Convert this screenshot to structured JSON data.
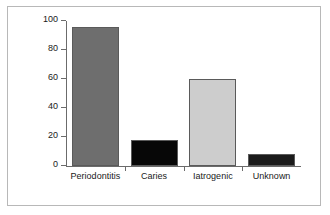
{
  "chart_data": {
    "type": "bar",
    "title": "",
    "xlabel": "",
    "ylabel": "Lost teeth (No.)",
    "categories": [
      "Periodontitis",
      "Caries",
      "Iatrogenic",
      "Unknown"
    ],
    "values": [
      96,
      18,
      60,
      8
    ],
    "bar_colors": [
      "#6e6e6e",
      "#070707",
      "#cdcdcd",
      "#1b1b1b"
    ],
    "ylim": [
      0,
      100
    ],
    "yticks": [
      0,
      20,
      40,
      60,
      80,
      100
    ],
    "ytick_labels": [
      "0",
      "20",
      "40",
      "60",
      "80",
      "100"
    ],
    "grid": false,
    "legend": "none"
  },
  "figure": {
    "frame_color": "#b8b8b8",
    "axis_color": "#6b6b6b",
    "background": "#ffffff"
  }
}
